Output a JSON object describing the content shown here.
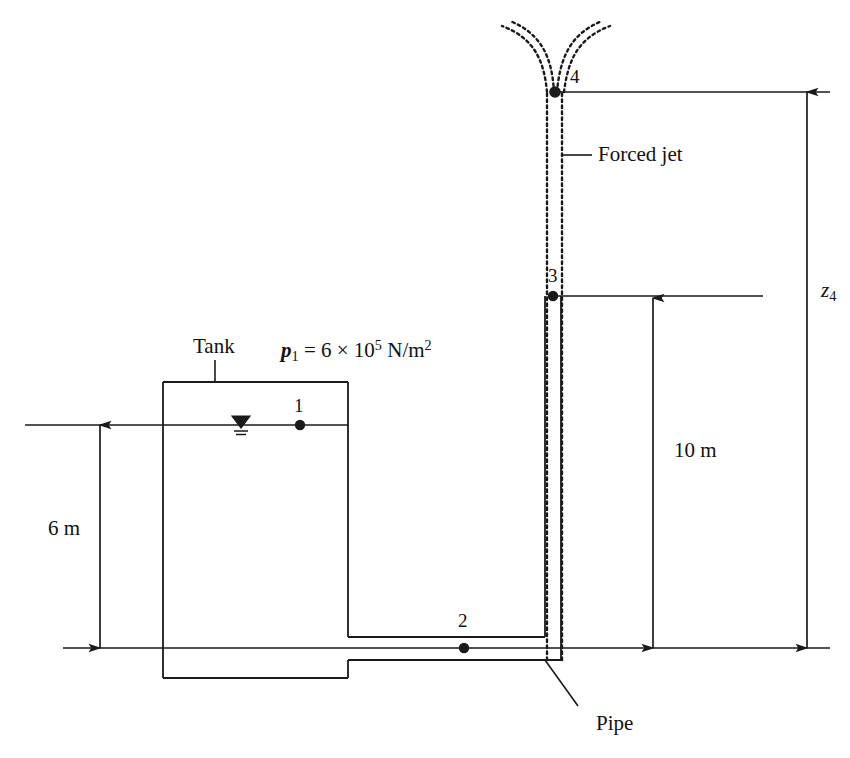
{
  "figure": {
    "background_color": "#ffffff",
    "line_color": "#1a1a1a"
  },
  "labels": {
    "tank": "Tank",
    "pipe": "Pipe",
    "forced_jet": "Forced jet",
    "point_1": "1",
    "point_2": "2",
    "point_3": "3",
    "point_4": "4"
  },
  "annotations": {
    "pressure": {
      "symbol": "p",
      "symbol_sub": "1",
      "equals": " = 6 × 10",
      "exponent": "5",
      "units": " N/m",
      "units_exponent": "2"
    },
    "elevation": {
      "symbol": "z",
      "symbol_sub": "4"
    }
  },
  "dimensions": [
    {
      "name": "tank-depth",
      "label": "6 m",
      "value": 6,
      "units": "m",
      "from": "water surface at point 1",
      "to": "pipe centerline datum"
    },
    {
      "name": "riser-height",
      "label": "10 m",
      "value": 10,
      "units": "m",
      "from": "point 3",
      "to": "pipe centerline datum"
    },
    {
      "name": "jet-elevation",
      "label": "z4",
      "value": null,
      "units": "m",
      "from": "point 4",
      "to": "pipe centerline datum"
    }
  ],
  "points": [
    {
      "id": "1",
      "label": "1",
      "x": 300,
      "y": 425,
      "description": "water surface inside tank"
    },
    {
      "id": "2",
      "label": "2",
      "x": 464,
      "y": 648,
      "description": "horizontal pipe centerline"
    },
    {
      "id": "3",
      "label": "3",
      "x": 553,
      "y": 296,
      "description": "top of riser pipe"
    },
    {
      "id": "4",
      "label": "4",
      "x": 555,
      "y": 92,
      "description": "top of forced jet"
    }
  ]
}
